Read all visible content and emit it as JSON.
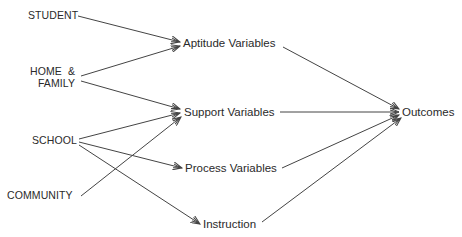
{
  "sources": {
    "student": "STUDENT",
    "home_line1": "HOME  &",
    "home_line2": "FAMILY",
    "school": "SCHOOL",
    "community": "COMMUNITY"
  },
  "intermediates": {
    "aptitude": "Aptitude Variables",
    "support": "Support Variables",
    "process": "Process Variables",
    "instruction": "Instruction"
  },
  "target": {
    "outcomes": "Outcomes"
  },
  "edges": [
    {
      "from": "STUDENT",
      "to": "Aptitude Variables"
    },
    {
      "from": "HOME & FAMILY",
      "to": "Aptitude Variables"
    },
    {
      "from": "HOME & FAMILY",
      "to": "Support Variables"
    },
    {
      "from": "SCHOOL",
      "to": "Support Variables"
    },
    {
      "from": "SCHOOL",
      "to": "Process Variables"
    },
    {
      "from": "SCHOOL",
      "to": "Instruction"
    },
    {
      "from": "COMMUNITY",
      "to": "Support Variables"
    },
    {
      "from": "Aptitude Variables",
      "to": "Outcomes"
    },
    {
      "from": "Support Variables",
      "to": "Outcomes"
    },
    {
      "from": "Process Variables",
      "to": "Outcomes"
    },
    {
      "from": "Instruction",
      "to": "Outcomes"
    }
  ],
  "colors": {
    "line": "#444444",
    "text": "#2a2a2a"
  }
}
